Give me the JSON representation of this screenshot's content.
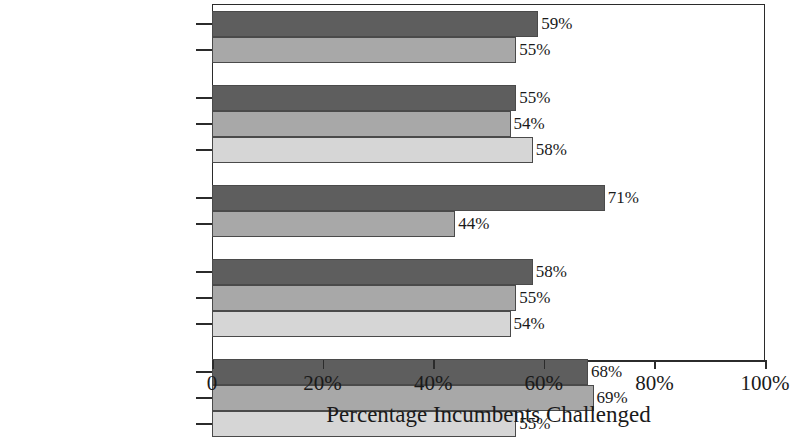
{
  "chart_data": {
    "type": "bar",
    "orientation": "horizontal",
    "title": "",
    "xlabel": "Percentage Incumbents Challenged",
    "ylabel": "",
    "xlim": [
      0,
      100
    ],
    "xticks": [
      "0",
      "20%",
      "40%",
      "60%",
      "80%",
      "100%"
    ],
    "xtick_values": [
      0,
      20,
      40,
      60,
      80,
      100
    ],
    "grid": false,
    "legend": "none",
    "value_suffix": "%",
    "groups": [
      {
        "name": "Gender",
        "bars": [
          {
            "label": "Women",
            "value": 59,
            "value_label": "59%",
            "shade": "dark"
          },
          {
            "label": "Men",
            "value": 55,
            "value_label": "55%",
            "shade": "medium"
          }
        ]
      },
      {
        "name": "Salary",
        "bars": [
          {
            "label": "Bottom Third Salary",
            "value": 55,
            "value_label": "55%",
            "shade": "dark"
          },
          {
            "label": "Middle Third Salary",
            "value": 54,
            "value_label": "54%",
            "shade": "medium"
          },
          {
            "label": "Top Third Salary",
            "value": 58,
            "value_label": "58%",
            "shade": "light"
          }
        ]
      },
      {
        "name": "Seats",
        "bars": [
          {
            "label": "Marginal Seats",
            "value": 71,
            "value_label": "71%",
            "shade": "dark"
          },
          {
            "label": "Safe Seats",
            "value": 44,
            "value_label": "44%",
            "shade": "medium"
          }
        ]
      },
      {
        "name": "State Economy",
        "bars": [
          {
            "label": "Bottom Third State Economy",
            "value": 58,
            "value_label": "58%",
            "shade": "dark"
          },
          {
            "label": "Middle Third State Economy",
            "value": 55,
            "value_label": "55%",
            "shade": "medium"
          },
          {
            "label": "Top Third State Economy",
            "value": 54,
            "value_label": "54%",
            "shade": "light"
          }
        ]
      },
      {
        "name": "Representation",
        "bars": [
          {
            "label": "Bottom Third Representation",
            "value": 68,
            "value_label": "68%",
            "shade": "dark"
          },
          {
            "label": "Middle Third Representation",
            "value": 69,
            "value_label": "69%",
            "shade": "medium"
          },
          {
            "label": "Top Third Representation",
            "value": 55,
            "value_label": "55%",
            "shade": "light"
          }
        ]
      }
    ],
    "colors": {
      "dark": "#5e5e5e",
      "medium": "#a8a8a8",
      "light": "#d6d6d6",
      "axis": "#2b2b2b",
      "text": "#1a1a1a",
      "background": "#ffffff"
    }
  }
}
